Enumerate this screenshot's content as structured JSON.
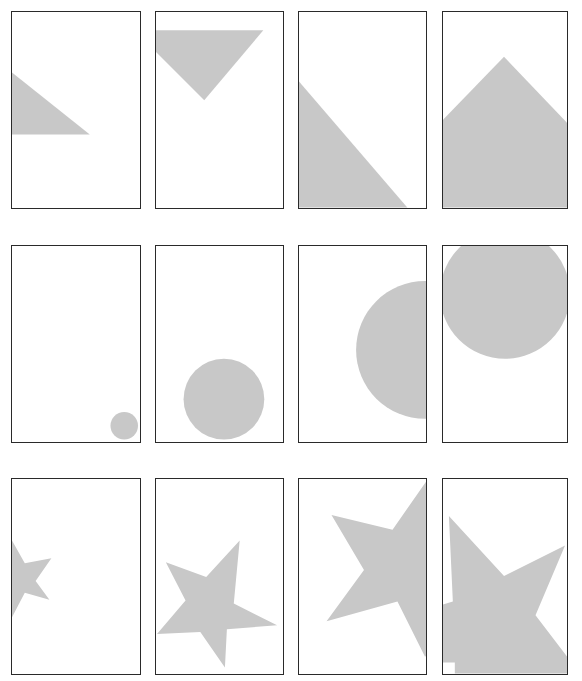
{
  "figure": {
    "shape_color": "#c8c8c8",
    "frame_color": "#2a2a2a",
    "background": "#ffffff",
    "rows": [
      {
        "name": "triangles",
        "panels": [
          {
            "shape": "triangle",
            "label": "triangle-left-edge"
          },
          {
            "shape": "triangle",
            "label": "inverted-triangle-top"
          },
          {
            "shape": "triangle",
            "label": "triangle-bottom-left-diagonal"
          },
          {
            "shape": "triangle",
            "label": "triangle-peak-bottom"
          }
        ]
      },
      {
        "name": "circles",
        "panels": [
          {
            "shape": "circle",
            "label": "small-circle-bottom-right"
          },
          {
            "shape": "circle",
            "label": "medium-circle-bottom"
          },
          {
            "shape": "circle",
            "label": "large-circle-right-edge"
          },
          {
            "shape": "circle",
            "label": "large-circle-top"
          }
        ]
      },
      {
        "name": "stars",
        "panels": [
          {
            "shape": "star",
            "label": "small-star-left-edge"
          },
          {
            "shape": "star",
            "label": "medium-star-bottom"
          },
          {
            "shape": "star",
            "label": "large-star-right-edge"
          },
          {
            "shape": "star",
            "label": "largest-star-filling-panel"
          }
        ]
      }
    ]
  }
}
